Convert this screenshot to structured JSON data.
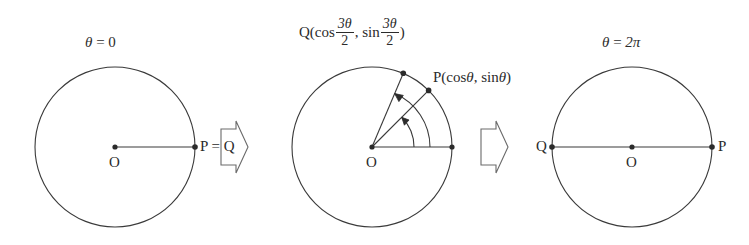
{
  "figure": {
    "background_color": "#ffffff",
    "stroke_color": "#3a3a3a",
    "text_color": "#2b2b2b"
  },
  "panels": [
    {
      "id": "panel-start",
      "angle_label_theta": "θ",
      "angle_label_eq": " = ",
      "angle_label_value": "0",
      "origin_label": "O",
      "point_label": "P = Q",
      "circle": {
        "cx": 115,
        "cy": 147,
        "r": 80
      }
    },
    {
      "id": "panel-middle",
      "origin_label": "O",
      "q_label_prefix": "Q(cos",
      "q_label_num1": "3θ",
      "q_label_den1": "2",
      "q_label_sep": ",  sin",
      "q_label_num2": "3θ",
      "q_label_den2": "2",
      "q_label_suffix": ")",
      "p_label_prefix": "P(cos",
      "p_label_var1": "θ",
      "p_label_mid": ",  sin",
      "p_label_var2": "θ",
      "p_label_suffix": ")",
      "circle": {
        "cx": 372,
        "cy": 147,
        "r": 80
      },
      "p_angle_degrees": 45,
      "q_angle_degrees": 67
    },
    {
      "id": "panel-end",
      "angle_label_theta": "θ",
      "angle_label_eq": " = ",
      "angle_label_value": "2π",
      "origin_label": "O",
      "left_point_label": "Q",
      "right_point_label": "P",
      "circle": {
        "cx": 632,
        "cy": 147,
        "r": 80
      }
    }
  ],
  "arrows": [
    {
      "id": "arrow-1",
      "direction": "right",
      "x": 232,
      "y": 147
    },
    {
      "id": "arrow-2",
      "direction": "right",
      "x": 492,
      "y": 147
    }
  ]
}
